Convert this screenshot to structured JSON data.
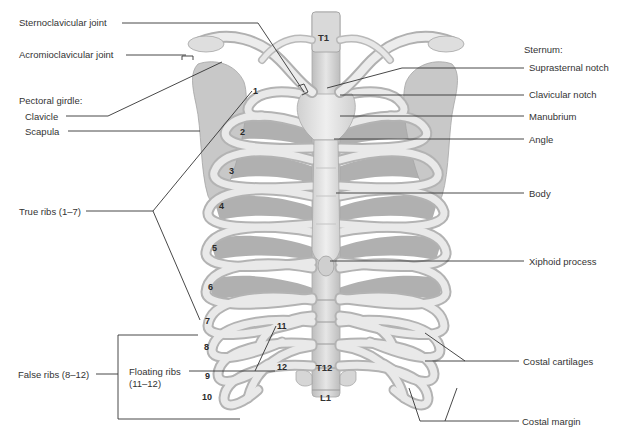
{
  "figure": {
    "colors": {
      "background": "#ffffff",
      "bone_light": "#eaeaea",
      "bone_mid": "#cfcfcf",
      "bone_shadow": "#a9a9a9",
      "muscle": "#9b9b9b",
      "leader_line": "#333333",
      "label_text": "#333333"
    }
  },
  "labels_left": {
    "sternoclavicular_joint": "Sternoclavicular joint",
    "acromioclavicular_joint": "Acromioclavicular joint",
    "pectoral_girdle": "Pectoral girdle:",
    "clavicle": "Clavicle",
    "scapula": "Scapula",
    "true_ribs": "True ribs (1–7)",
    "false_ribs": "False ribs (8–12)",
    "floating_ribs_line1": "Floating ribs",
    "floating_ribs_line2": "(11–12)"
  },
  "labels_right": {
    "sternum": "Sternum:",
    "suprasternal_notch": "Suprasternal notch",
    "clavicular_notch": "Clavicular notch",
    "manubrium": "Manubrium",
    "angle": "Angle",
    "body": "Body",
    "xiphoid_process": "Xiphoid process",
    "costal_cartilages": "Costal cartilages",
    "costal_margin": "Costal margin"
  },
  "rib_numbers": [
    "1",
    "2",
    "3",
    "4",
    "5",
    "6",
    "7",
    "8",
    "9",
    "10",
    "11",
    "12"
  ],
  "vertebrae": {
    "t1": "T1",
    "t12": "T12",
    "l1": "L1"
  }
}
